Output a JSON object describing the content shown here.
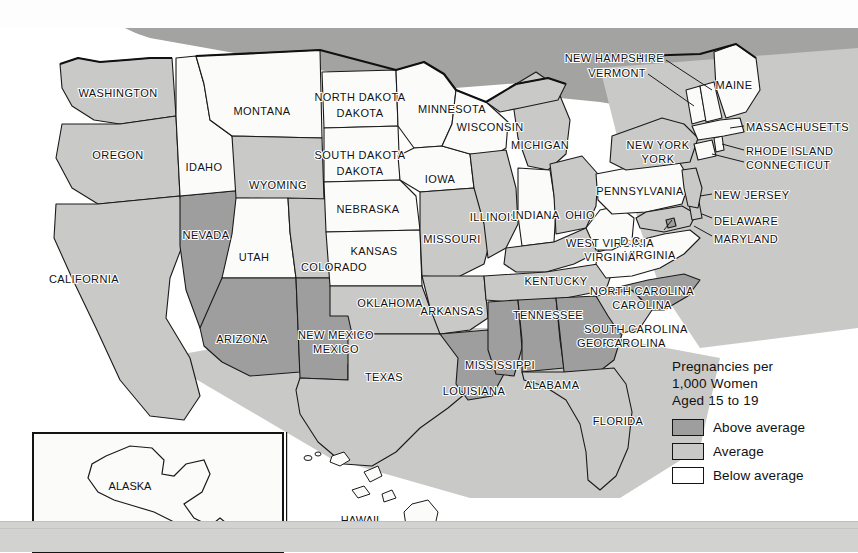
{
  "map": {
    "title": "United States teen pregnancy rate choropleth map",
    "legend": {
      "title_line1": "Pregnancies per",
      "title_line2": "1,000 Women",
      "title_line3": "Aged 15 to 19",
      "items": [
        {
          "key": "above",
          "label": "Above average",
          "color": "#9e9e9e"
        },
        {
          "key": "average",
          "label": "Average",
          "color": "#c9c9c7"
        },
        {
          "key": "below",
          "label": "Below average",
          "color": "#ffffff"
        }
      ]
    },
    "insets": [
      {
        "name": "alaska",
        "label": "ALASKA",
        "category": "below"
      },
      {
        "name": "hawaii",
        "label": "HAWAII",
        "category": "below"
      }
    ],
    "states": [
      {
        "code": "WA",
        "label": "WASHINGTON",
        "category": "average"
      },
      {
        "code": "OR",
        "label": "OREGON",
        "category": "average"
      },
      {
        "code": "CA",
        "label": "CALIFORNIA",
        "category": "average"
      },
      {
        "code": "NV",
        "label": "NEVADA",
        "category": "above"
      },
      {
        "code": "ID",
        "label": "IDAHO",
        "category": "below"
      },
      {
        "code": "MT",
        "label": "MONTANA",
        "category": "below"
      },
      {
        "code": "WY",
        "label": "WYOMING",
        "category": "average"
      },
      {
        "code": "UT",
        "label": "UTAH",
        "category": "below"
      },
      {
        "code": "AZ",
        "label": "ARIZONA",
        "category": "above"
      },
      {
        "code": "CO",
        "label": "COLORADO",
        "category": "average"
      },
      {
        "code": "NM",
        "label": "NEW MEXICO",
        "category": "above"
      },
      {
        "code": "ND",
        "label": "NORTH DAKOTA",
        "category": "below"
      },
      {
        "code": "SD",
        "label": "SOUTH DAKOTA",
        "category": "below"
      },
      {
        "code": "NE",
        "label": "NEBRASKA",
        "category": "below"
      },
      {
        "code": "KS",
        "label": "KANSAS",
        "category": "below"
      },
      {
        "code": "OK",
        "label": "OKLAHOMA",
        "category": "average"
      },
      {
        "code": "TX",
        "label": "TEXAS",
        "category": "average"
      },
      {
        "code": "MN",
        "label": "MINNESOTA",
        "category": "below"
      },
      {
        "code": "IA",
        "label": "IOWA",
        "category": "below"
      },
      {
        "code": "MO",
        "label": "MISSOURI",
        "category": "average"
      },
      {
        "code": "AR",
        "label": "ARKANSAS",
        "category": "average"
      },
      {
        "code": "LA",
        "label": "LOUISIANA",
        "category": "above"
      },
      {
        "code": "WI",
        "label": "WISCONSIN",
        "category": "below"
      },
      {
        "code": "IL",
        "label": "ILLINOIS",
        "category": "average"
      },
      {
        "code": "MI",
        "label": "MICHIGAN",
        "category": "average"
      },
      {
        "code": "IN",
        "label": "INDIANA",
        "category": "below"
      },
      {
        "code": "OH",
        "label": "OHIO",
        "category": "average"
      },
      {
        "code": "KY",
        "label": "KENTUCKY",
        "category": "average"
      },
      {
        "code": "TN",
        "label": "TENNESSEE",
        "category": "average"
      },
      {
        "code": "MS",
        "label": "MISSISSIPPI",
        "category": "above"
      },
      {
        "code": "AL",
        "label": "ALABAMA",
        "category": "above"
      },
      {
        "code": "GA",
        "label": "GEORGIA",
        "category": "above"
      },
      {
        "code": "FL",
        "label": "FLORIDA",
        "category": "average"
      },
      {
        "code": "SC",
        "label": "SOUTH CAROLINA",
        "category": "average"
      },
      {
        "code": "NC",
        "label": "NORTH CAROLINA",
        "category": "above"
      },
      {
        "code": "VA",
        "label": "VIRGINIA",
        "category": "below"
      },
      {
        "code": "WV",
        "label": "WEST VIRGINIA",
        "category": "below"
      },
      {
        "code": "MD",
        "label": "MARYLAND",
        "category": "average"
      },
      {
        "code": "DE",
        "label": "DELAWARE",
        "category": "average"
      },
      {
        "code": "DC",
        "label": "D.C.",
        "category": "above"
      },
      {
        "code": "PA",
        "label": "PENNSYLVANIA",
        "category": "below"
      },
      {
        "code": "NJ",
        "label": "NEW JERSEY",
        "category": "average"
      },
      {
        "code": "NY",
        "label": "NEW YORK",
        "category": "average"
      },
      {
        "code": "CT",
        "label": "CONNECTICUT",
        "category": "below"
      },
      {
        "code": "RI",
        "label": "RHODE ISLAND",
        "category": "below"
      },
      {
        "code": "MA",
        "label": "MASSACHUSETTS",
        "category": "below"
      },
      {
        "code": "VT",
        "label": "VERMONT",
        "category": "below"
      },
      {
        "code": "NH",
        "label": "NEW HAMPSHIRE",
        "category": "below"
      },
      {
        "code": "ME",
        "label": "MAINE",
        "category": "below"
      }
    ]
  }
}
